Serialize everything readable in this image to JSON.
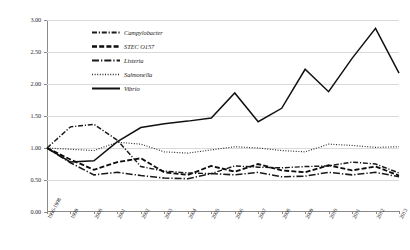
{
  "chart_data": {
    "type": "line",
    "title": "",
    "subtitle": "",
    "xlabel": "",
    "ylabel": "",
    "ylim": [
      0.0,
      3.0
    ],
    "ytick_labels": [
      "0.00",
      "0.50",
      "1.00",
      "1.50",
      "2.00",
      "2.50",
      "3.00"
    ],
    "ytick_values": [
      0.0,
      0.5,
      1.0,
      1.5,
      2.0,
      2.5,
      3.0
    ],
    "grid": true,
    "legend_position": "upper-left-inside",
    "categories": [
      "1996-1998",
      "1999",
      "2000",
      "2001",
      "2002",
      "2003",
      "2004",
      "2005",
      "2006",
      "2007",
      "2008",
      "2009",
      "2010",
      "2011",
      "2012",
      "2013"
    ],
    "series": [
      {
        "name": "Campylobacter",
        "line_style": "dash-dot",
        "color": "#1a1a1a",
        "values": [
          1.0,
          1.33,
          1.37,
          1.12,
          0.71,
          0.64,
          0.61,
          0.6,
          0.72,
          0.7,
          0.69,
          0.71,
          0.72,
          0.78,
          0.75,
          0.61
        ]
      },
      {
        "name": "STEC O157",
        "line_style": "dash",
        "color": "#0d0d0d",
        "values": [
          1.0,
          0.82,
          0.66,
          0.78,
          0.84,
          0.62,
          0.58,
          0.72,
          0.63,
          0.75,
          0.65,
          0.62,
          0.73,
          0.65,
          0.71,
          0.57
        ]
      },
      {
        "name": "Listeria",
        "line_style": "long-dash-dot",
        "color": "#1a1a1a",
        "values": [
          1.0,
          0.77,
          0.58,
          0.62,
          0.57,
          0.53,
          0.52,
          0.6,
          0.58,
          0.62,
          0.55,
          0.56,
          0.62,
          0.58,
          0.62,
          0.55
        ]
      },
      {
        "name": "Salmonella",
        "line_style": "dotted",
        "color": "#2b2b2b",
        "values": [
          1.0,
          0.98,
          0.96,
          1.09,
          1.06,
          0.94,
          0.92,
          0.97,
          1.02,
          1.0,
          0.96,
          0.94,
          1.06,
          1.04,
          1.01,
          1.02
        ]
      },
      {
        "name": "Vibrio",
        "line_style": "solid",
        "color": "#111111",
        "values": [
          1.0,
          0.78,
          0.8,
          1.1,
          1.32,
          1.38,
          1.42,
          1.47,
          1.86,
          1.41,
          1.62,
          2.23,
          1.88,
          2.4,
          2.87,
          2.17
        ]
      }
    ]
  }
}
